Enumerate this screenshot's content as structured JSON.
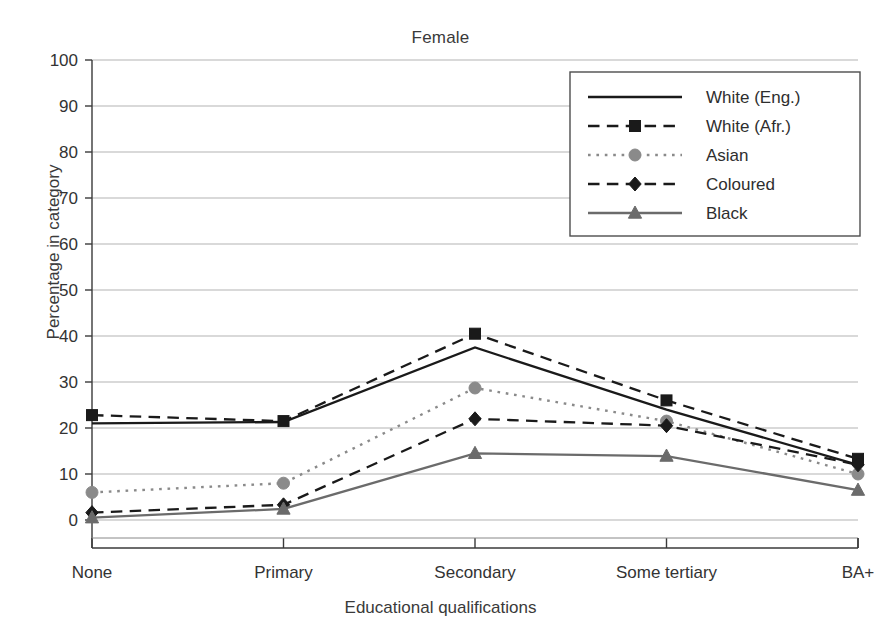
{
  "chart_data": {
    "type": "line",
    "title": "Female",
    "xlabel": "Educational qualifications",
    "ylabel": "Percentage in category",
    "categories": [
      "None",
      "Primary",
      "Secondary",
      "Some tertiary",
      "BA+"
    ],
    "ylim": [
      0,
      100
    ],
    "yticks": [
      0,
      10,
      20,
      30,
      40,
      50,
      60,
      70,
      80,
      90,
      100
    ],
    "grid": true,
    "legend_position": "top-right",
    "series": [
      {
        "name": "White (Eng.)",
        "values": [
          21.0,
          21.3,
          37.5,
          24.0,
          12.0
        ],
        "color": "#1a1a1a",
        "style": "solid",
        "marker": "none"
      },
      {
        "name": "White (Afr.)",
        "values": [
          22.8,
          21.5,
          40.5,
          26.0,
          13.3
        ],
        "color": "#1a1a1a",
        "style": "dashed",
        "marker": "square"
      },
      {
        "name": "Asian",
        "values": [
          6.0,
          8.0,
          28.7,
          21.5,
          10.0
        ],
        "color": "#8a8a8a",
        "style": "dotted",
        "marker": "circle"
      },
      {
        "name": "Coloured",
        "values": [
          1.6,
          3.3,
          22.0,
          20.5,
          12.0
        ],
        "color": "#1a1a1a",
        "style": "dashed",
        "marker": "diamond"
      },
      {
        "name": "Black",
        "values": [
          0.5,
          2.4,
          14.5,
          13.9,
          6.5
        ],
        "color": "#6b6b6b",
        "style": "solid",
        "marker": "triangle"
      }
    ]
  }
}
